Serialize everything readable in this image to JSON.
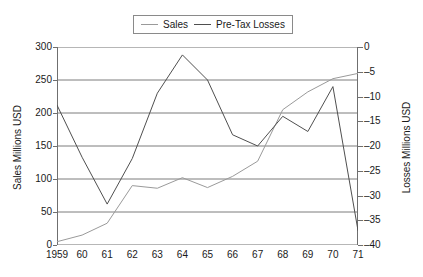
{
  "chart_data": {
    "type": "line",
    "title": "",
    "xlabel": "",
    "ylabel": "Sales Millions USD",
    "y2label": "Losses Millions USD",
    "categories": [
      "1959",
      "60",
      "61",
      "62",
      "63",
      "64",
      "65",
      "66",
      "67",
      "68",
      "69",
      "70",
      "71"
    ],
    "x_tick_labels": [
      "1959",
      "60",
      "61",
      "62",
      "63",
      "64",
      "65",
      "66",
      "67",
      "68",
      "69",
      "70",
      "71"
    ],
    "y_tick_labels": [
      "300",
      "250",
      "200",
      "150",
      "100",
      "50",
      "0"
    ],
    "y_ticks": [
      300,
      250,
      200,
      150,
      100,
      50,
      0
    ],
    "ylim": [
      0,
      300
    ],
    "y2_tick_labels": [
      "0",
      "–5",
      "–10",
      "–15",
      "–20",
      "–25",
      "–30",
      "–35",
      "–40"
    ],
    "y2_ticks": [
      0,
      -5,
      -10,
      -15,
      -20,
      -25,
      -30,
      -35,
      -40
    ],
    "y2lim": [
      -40,
      0
    ],
    "grid": true,
    "legend_position": "top-center",
    "series": [
      {
        "name": "Sales",
        "axis": "left",
        "color": "#9a9a9a",
        "values": [
          5,
          15,
          33,
          90,
          86,
          102,
          87,
          104,
          127,
          205,
          232,
          252,
          260
        ]
      },
      {
        "name": "Pre-Tax Losses",
        "axis": "right",
        "color": "#4f4f4f",
        "values": [
          -11.7,
          -22.3,
          -31.7,
          -22.5,
          -9.3,
          -1.6,
          -6.7,
          -17.7,
          -20.0,
          -14.0,
          -17.1,
          -8.0,
          -37.1
        ],
        "values_left_scale": [
          212,
          133,
          62,
          131,
          230,
          288,
          250,
          167,
          150,
          195,
          172,
          240,
          22
        ]
      }
    ],
    "legend": [
      {
        "label": "Sales",
        "color": "#9a9a9a"
      },
      {
        "label": "Pre-Tax Losses",
        "color": "#4f4f4f"
      }
    ]
  },
  "axes": {
    "left_title": "Sales Millions USD",
    "right_title": "Losses Millions USD"
  },
  "legend": {
    "sales_label": "Sales",
    "losses_label": "Pre-Tax Losses"
  },
  "yticks_left": [
    "300",
    "250",
    "200",
    "150",
    "100",
    "50",
    "0"
  ],
  "yticks_right": [
    "0",
    "–5",
    "–10",
    "–15",
    "–20",
    "–25",
    "–30",
    "–35",
    "–40"
  ],
  "xticks": [
    "1959",
    "60",
    "61",
    "62",
    "63",
    "64",
    "65",
    "66",
    "67",
    "68",
    "69",
    "70",
    "71"
  ]
}
